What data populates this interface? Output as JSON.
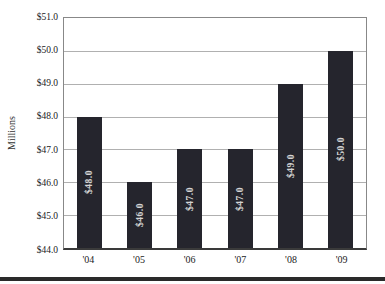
{
  "chart_data": {
    "type": "bar",
    "categories": [
      "'04",
      "'05",
      "'06",
      "'07",
      "'08",
      "'09"
    ],
    "values": [
      48.0,
      46.0,
      47.0,
      47.0,
      49.0,
      50.0
    ],
    "bar_labels": [
      "$48.0",
      "$46.0",
      "$47.0",
      "$47.0",
      "$49.0",
      "$50.0"
    ],
    "title": "",
    "xlabel": "",
    "ylabel": "Millions",
    "ylim": [
      44.0,
      51.0
    ],
    "ytick_step": 1.0,
    "ytick_labels": [
      "$51.0",
      "$50.0",
      "$49.0",
      "$48.0",
      "$47.0",
      "$46.0",
      "$45.0",
      "$44.0"
    ],
    "grid": true,
    "legend": "none",
    "colors": {
      "bar_fill": "#25252d",
      "bar_label": "#d4d4d4",
      "gridline": "#b0b0b0",
      "plot_border": "#888888",
      "axis_line": "#3a3a3a",
      "tick_label": "#222222",
      "footer_bar": "#2a2a2a"
    }
  }
}
